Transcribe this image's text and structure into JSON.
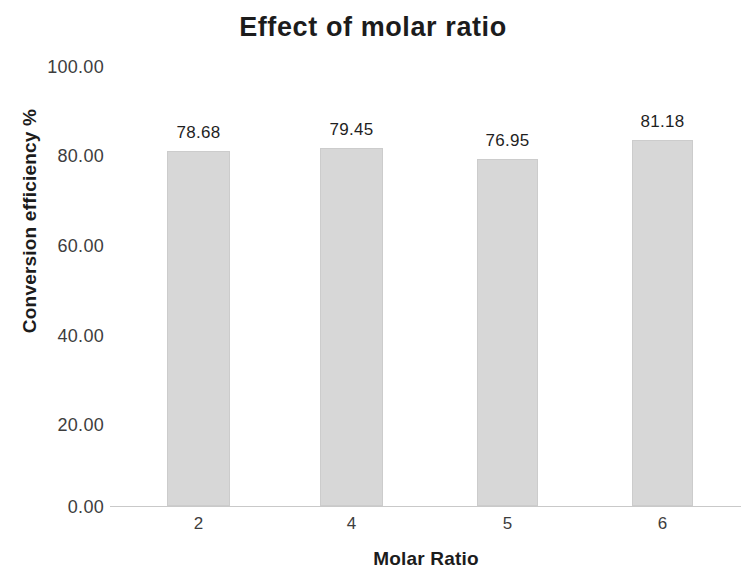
{
  "chart_data": {
    "type": "bar",
    "title": "Effect of molar ratio",
    "xlabel": "Molar Ratio",
    "ylabel": "Conversion efficiency %",
    "categories": [
      "2",
      "4",
      "5",
      "6"
    ],
    "values": [
      78.68,
      79.45,
      76.95,
      81.18
    ],
    "data_labels": [
      "78.68",
      "79.45",
      "76.95",
      "81.18"
    ],
    "ylim": [
      0,
      100
    ],
    "yticks": [
      0,
      20,
      40,
      60,
      80,
      100
    ],
    "ytick_labels": [
      "0.00",
      "20.00",
      "40.00",
      "60.00",
      "80.00",
      "100.00"
    ],
    "xtick_labels": [
      "2",
      "4",
      "5",
      "6"
    ],
    "grid": false,
    "legend": false,
    "legend_position": "none",
    "bar_color": "#d7d7d7",
    "bar_border_color": "#cccccc",
    "axis_line_color": "#c9c9c9",
    "text_color": "#1c1c1c",
    "background_color": "#ffffff"
  }
}
